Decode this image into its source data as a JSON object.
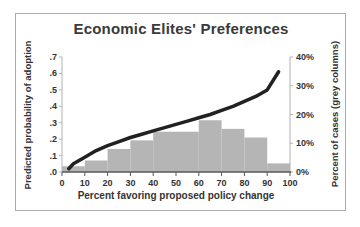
{
  "window": {
    "background": "#ffffff",
    "frame_border_color": "#ababab"
  },
  "chart_data": {
    "type": "combo",
    "title": "Economic Elites' Preferences",
    "xlabel": "Percent favoring proposed policy change",
    "ylabel_left": "Predicted probability of adoption",
    "ylabel_right": "Percent of cases (grey columns)",
    "x_range": [
      0,
      100
    ],
    "x_tick_values": [
      0,
      10,
      20,
      30,
      40,
      50,
      60,
      70,
      80,
      90,
      100
    ],
    "x_tick_labels": [
      "0",
      "10",
      "20",
      "30",
      "40",
      "50",
      "60",
      "70",
      "80",
      "90",
      "100"
    ],
    "left_axis_range": [
      0,
      0.7
    ],
    "left_tick_values": [
      0,
      0.1,
      0.2,
      0.3,
      0.4,
      0.5,
      0.6,
      0.7
    ],
    "left_tick_labels": [
      ".0",
      ".1",
      ".2",
      ".3",
      ".4",
      ".5",
      ".6",
      ".7"
    ],
    "right_axis_range": [
      0,
      40
    ],
    "right_tick_values": [
      0,
      10,
      20,
      30,
      40
    ],
    "right_tick_labels": [
      "0%",
      "10%",
      "20%",
      "30%",
      "40%"
    ],
    "grid": false,
    "legend": "none",
    "series": [
      {
        "name": "percent-of-cases",
        "type": "bar",
        "axis": "right",
        "color": "#b5b5b5",
        "bins": [
          [
            0,
            10
          ],
          [
            10,
            20
          ],
          [
            20,
            30
          ],
          [
            30,
            40
          ],
          [
            40,
            50
          ],
          [
            50,
            60
          ],
          [
            60,
            70
          ],
          [
            70,
            80
          ],
          [
            80,
            90
          ],
          [
            90,
            100
          ]
        ],
        "values": [
          2,
          4,
          8,
          11,
          14,
          14,
          18,
          15,
          12,
          3
        ]
      },
      {
        "name": "predicted-probability",
        "type": "line",
        "axis": "left",
        "color": "#212121",
        "stroke_width": 3.5,
        "points": [
          [
            3,
            0.02
          ],
          [
            5,
            0.05
          ],
          [
            10,
            0.09
          ],
          [
            15,
            0.13
          ],
          [
            20,
            0.16
          ],
          [
            25,
            0.185
          ],
          [
            30,
            0.21
          ],
          [
            35,
            0.23
          ],
          [
            40,
            0.25
          ],
          [
            45,
            0.27
          ],
          [
            50,
            0.29
          ],
          [
            55,
            0.31
          ],
          [
            60,
            0.33
          ],
          [
            65,
            0.35
          ],
          [
            70,
            0.375
          ],
          [
            75,
            0.4
          ],
          [
            80,
            0.43
          ],
          [
            85,
            0.46
          ],
          [
            90,
            0.5
          ],
          [
            95,
            0.61
          ]
        ]
      }
    ],
    "axis_colors": {
      "bottom_axis": "#595959",
      "side_axis": "#b3b3b3",
      "tick_text": "#333333"
    }
  }
}
